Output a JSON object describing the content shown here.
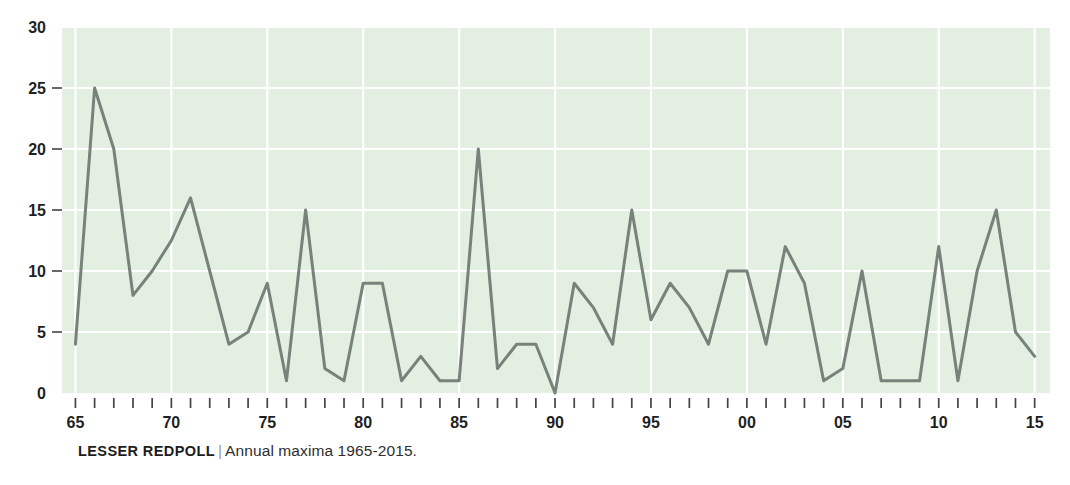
{
  "caption": {
    "series_name": "LESSER REDPOLL",
    "separator": "|",
    "description": "Annual maxima 1965-2015."
  },
  "colors": {
    "plot_background": "#e2efe1",
    "gridline": "#ffffff",
    "line": "#76827a",
    "tick": "#444444",
    "text": "#1f1f1f",
    "page_background": "#ffffff"
  },
  "chart_data": {
    "type": "line",
    "title": "LESSER REDPOLL",
    "subtitle": "Annual maxima 1965-2015.",
    "xlabel": "",
    "ylabel": "",
    "grid": true,
    "legend": "none",
    "xlim": [
      1964.3,
      2015.8
    ],
    "ylim": [
      0,
      30
    ],
    "ytick_labels": [
      "0",
      "5",
      "10",
      "15",
      "20",
      "25",
      "30"
    ],
    "ytick_values": [
      0,
      5,
      10,
      15,
      20,
      25,
      30
    ],
    "xtick_labels": [
      "65",
      "70",
      "75",
      "80",
      "85",
      "90",
      "95",
      "00",
      "05",
      "10",
      "15"
    ],
    "xtick_values": [
      1965,
      1970,
      1975,
      1980,
      1985,
      1990,
      1995,
      2000,
      2005,
      2010,
      2015
    ],
    "x": [
      1965,
      1966,
      1967,
      1968,
      1969,
      1970,
      1971,
      1972,
      1973,
      1974,
      1975,
      1976,
      1977,
      1978,
      1979,
      1980,
      1981,
      1982,
      1983,
      1984,
      1985,
      1986,
      1987,
      1988,
      1989,
      1990,
      1991,
      1992,
      1993,
      1994,
      1995,
      1996,
      1997,
      1998,
      1999,
      2000,
      2001,
      2002,
      2003,
      2004,
      2005,
      2006,
      2007,
      2008,
      2009,
      2010,
      2011,
      2012,
      2013,
      2014,
      2015
    ],
    "values": [
      4,
      25,
      20,
      8,
      10,
      12.5,
      16,
      10,
      4,
      5,
      9,
      1,
      15,
      2,
      1,
      9,
      9,
      1,
      3,
      1,
      1,
      20,
      2,
      4,
      4,
      0,
      9,
      7,
      4,
      15,
      6,
      9,
      7,
      4,
      10,
      10,
      4,
      12,
      9,
      1,
      2,
      10,
      1,
      1,
      1,
      12,
      1,
      10,
      15,
      5,
      3
    ]
  }
}
